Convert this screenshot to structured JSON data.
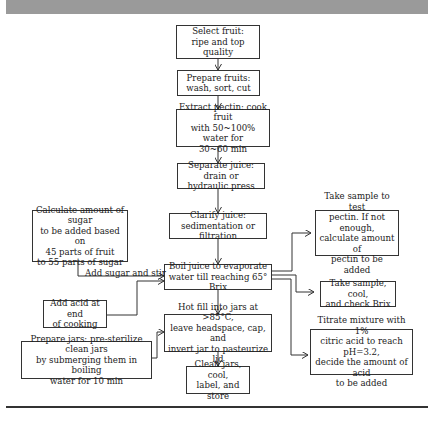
{
  "diagram": {
    "type": "flowchart",
    "main_steps": [
      {
        "id": "select",
        "text": "Select fruit:\nripe and top quality"
      },
      {
        "id": "prepare",
        "text": "Prepare fruits:\nwash, sort, cut"
      },
      {
        "id": "extract",
        "text": "Extract pectin: cook fruit\nwith 50~100% water for\n30~60 min"
      },
      {
        "id": "separate",
        "text": "Separate juice: drain or\nhydraulic press"
      },
      {
        "id": "clarify",
        "text": "Clarify juice:\nsedimentation or filtration"
      },
      {
        "id": "boil",
        "text": "Boil juice to evaporate\nwater till reaching 65° Brix"
      },
      {
        "id": "hotfill",
        "text": "Hot fill into jars at >85°C,\nleave headspace, cap, and\ninvert jar to pasteurize lid"
      },
      {
        "id": "clean",
        "text": "Clean jars, cool,\nlabel, and store"
      }
    ],
    "left_inputs": [
      {
        "id": "sugar",
        "text": "Calculate amount of sugar\nto be added based on\n45 parts of fruit\nto 55 parts of sugar"
      },
      {
        "id": "acid",
        "text": "Add acid at end\nof cooking"
      },
      {
        "id": "jars",
        "text": "Prepare jars: pre-sterilize clean jars\nby submerging them in boiling\nwater for 10 min"
      }
    ],
    "right_checks": [
      {
        "id": "pectin",
        "text": "Take sample to test\npectin. If not enough,\ncalculate amount of\npectin to be added"
      },
      {
        "id": "brix",
        "text": "Take sample, cool,\nand check Brix"
      },
      {
        "id": "titrate",
        "text": "Titrate mixture with 1%\ncitric acid to reach pH=3.2,\ndecide the amount of acid\nto be added"
      }
    ],
    "edge_labels": {
      "sugar_edge": "Add sugar and stir"
    },
    "edges": [
      [
        "select",
        "prepare"
      ],
      [
        "prepare",
        "extract"
      ],
      [
        "extract",
        "separate"
      ],
      [
        "separate",
        "clarify"
      ],
      [
        "clarify",
        "boil"
      ],
      [
        "boil",
        "hotfill"
      ],
      [
        "hotfill",
        "clean"
      ],
      [
        "sugar",
        "boil"
      ],
      [
        "acid",
        "boil"
      ],
      [
        "jars",
        "hotfill"
      ],
      [
        "boil",
        "pectin"
      ],
      [
        "boil",
        "brix"
      ],
      [
        "boil",
        "titrate"
      ]
    ]
  }
}
